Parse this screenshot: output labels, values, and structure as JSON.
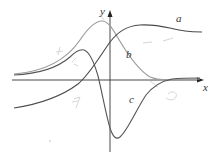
{
  "figure": {
    "axes": {
      "x_label": "x",
      "y_label": "y"
    },
    "curves": [
      {
        "label": "a",
        "color": "#444444",
        "description": "sigmoid-like curve rising from lower left, crossing y-axis, peaking then leveling off"
      },
      {
        "label": "b",
        "color": "#9a9a9a",
        "description": "bell-shaped curve peaking near the y-axis and decaying to x-axis"
      },
      {
        "label": "c",
        "color": "#555555",
        "description": "curve rising to a peak left of y-axis, dipping to a deep minimum right of y-axis, then returning to x-axis"
      }
    ],
    "colors": {
      "axis": "#333333",
      "background": "#ffffff",
      "annotation": "#cfcfcf"
    }
  }
}
